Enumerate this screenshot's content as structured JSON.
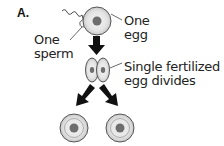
{
  "figure": {
    "panel_label": "A.",
    "labels": {
      "sperm": [
        "One",
        "sperm"
      ],
      "egg": [
        "One",
        "egg"
      ],
      "divides": [
        "Single fertilized",
        "egg divides"
      ]
    },
    "colors": {
      "cell_fill": "#e6e6e6",
      "cell_outline": "#555555",
      "nucleus": "#6e6e6e",
      "arrow": "#111111"
    }
  }
}
